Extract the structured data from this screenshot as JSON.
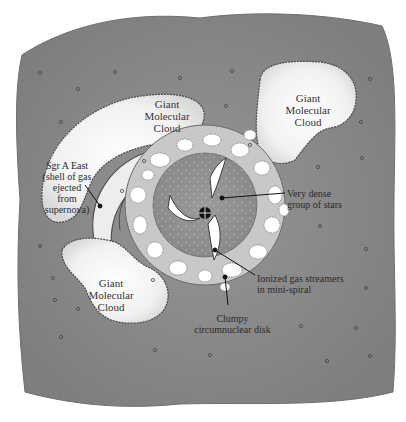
{
  "diagram": {
    "background_color": "#8a8a8a",
    "labels": {
      "gmc_top_left": "Giant\nMolecular\nCloud",
      "gmc_top_right": "Giant\nMolecular\nCloud",
      "gmc_bottom_left": "Giant\nMolecular\nCloud",
      "sgr_a_east": "Sgr A East\n(shell of gas\nejected\nfrom\nsupernova)",
      "dense_stars": "Very dense\ngroup of stars",
      "ionized_gas": "Ionized gas streamers\nin mini-spiral",
      "clumpy_disk": "Clumpy\ncircumnuclear disk"
    },
    "center_marker": "black-hole-crosshair",
    "decorations": {
      "star_count": 24
    }
  }
}
